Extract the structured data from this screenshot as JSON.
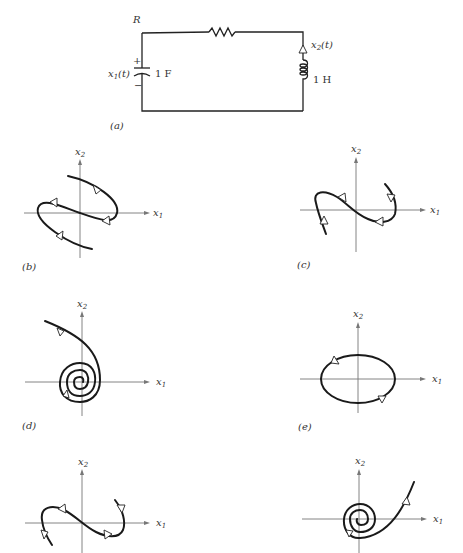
{
  "circuit": {
    "panel_label": "(a)",
    "resistor_label": "R",
    "capacitor_label": "1 F",
    "inductor_label": "1 H",
    "voltage_label": "x",
    "voltage_sub": "1",
    "voltage_arg": "(t)",
    "current_label": "x",
    "current_sub": "2",
    "current_arg": "(t)",
    "plus": "+",
    "minus": "−"
  },
  "axes": {
    "x_label": "x",
    "x_sub": "1",
    "y_label": "x",
    "y_sub": "2"
  },
  "panels": [
    {
      "id": "b",
      "label": "(b)",
      "description": "S-shaped trajectory with loops, arrows directed around"
    },
    {
      "id": "c",
      "label": "(c)",
      "description": "S-shaped trajectory through origin, arrows inward"
    },
    {
      "id": "d",
      "label": "(d)",
      "description": "Stable spiral converging to origin"
    },
    {
      "id": "e",
      "label": "(e)",
      "description": "Closed elliptic orbit (center)"
    },
    {
      "id": "f",
      "label": "",
      "description": "S-shaped trajectory, arrows outward"
    },
    {
      "id": "g",
      "label": "",
      "description": "Unstable spiral diverging from origin"
    }
  ]
}
